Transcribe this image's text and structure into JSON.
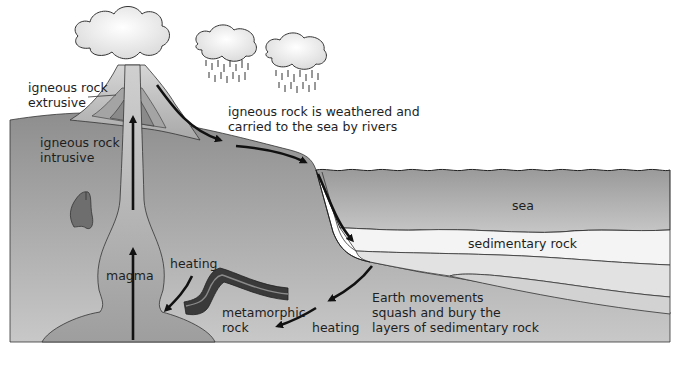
{
  "diagram": {
    "labels": {
      "igneous_extrusive_1": "igneous rock",
      "igneous_extrusive_2": "extrusive",
      "igneous_intrusive_1": "igneous rock",
      "igneous_intrusive_2": "intrusive",
      "weathered_1": "igneous rock is weathered and",
      "weathered_2": "carried to the sea by rivers",
      "sea": "sea",
      "sedimentary": "sedimentary rock",
      "magma": "magma",
      "heating_left": "heating",
      "metamorphic_1": "metamorphic",
      "metamorphic_2": "rock",
      "heating_bottom": "heating",
      "earth_1": "Earth movements",
      "earth_2": "squash and bury the",
      "earth_3": "layers of sedimentary rock"
    },
    "colors": {
      "land": "#9c9c9c",
      "sea": "#a8a8a8",
      "sediment_light": "#f4f4f4",
      "volcano": "#c4c4c4",
      "magma": "#b4b4b4",
      "metamorphic": "#3a3a3a",
      "arrow": "#111111"
    }
  }
}
